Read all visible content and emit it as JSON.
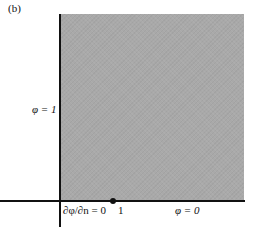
{
  "panel_label": "(b)",
  "diagram": {
    "region": {
      "fill": "#a9a9a9",
      "shape": "square"
    },
    "left_boundary_label": "φ = 1",
    "bottom_left_label": "∂φ/∂n = 0",
    "point_label": "1",
    "bottom_right_label": "φ = 0"
  }
}
